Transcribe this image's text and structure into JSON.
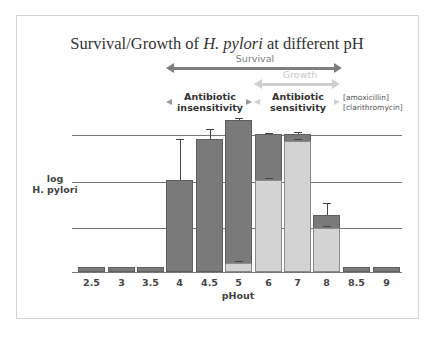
{
  "chart_data": {
    "type": "bar",
    "title": "Survival/Growth of H. pylori at different pH",
    "xlabel": "pHout",
    "ylabel": "log H. pylori",
    "categories": [
      "2.5",
      "3",
      "3.5",
      "4",
      "4.5",
      "5",
      "6",
      "7",
      "8",
      "8.5",
      "9"
    ],
    "series": [
      {
        "name": "Survival (dark)",
        "values": [
          0.1,
          0.1,
          0.1,
          2.0,
          2.9,
          3.3,
          3.0,
          3.0,
          1.25,
          0.1,
          0.1
        ],
        "error_upper": [
          null,
          null,
          null,
          2.9,
          3.1,
          3.35,
          3.02,
          3.05,
          1.5,
          null,
          null
        ],
        "color": "#7a7a7a"
      },
      {
        "name": "Growth (light)",
        "values": [
          0,
          0,
          0,
          0,
          0,
          0.2,
          2.0,
          2.85,
          0.95,
          0,
          0
        ],
        "color": "#d3d3d3"
      }
    ],
    "ylim": [
      0,
      3.4
    ],
    "gridlines": [
      1,
      2,
      3
    ],
    "grid": true,
    "annotations": [
      {
        "text": "Survival",
        "type": "arrow",
        "from": "4",
        "to": "8"
      },
      {
        "text": "Growth",
        "type": "arrow",
        "from": "6",
        "to": "8"
      },
      {
        "text": "Antibiotic insensitivity",
        "type": "arrow",
        "from": "4",
        "to": "5"
      },
      {
        "text": "Antibiotic sensitivity",
        "type": "arrow",
        "from": "6",
        "to": "8"
      },
      {
        "text": "[amoxicillin] [clarithromycin]"
      }
    ]
  },
  "title": {
    "prefix": "Survival/Growth of ",
    "italic": "H. pylori",
    "suffix": " at different pH"
  },
  "arrows": {
    "survival": {
      "label": "Survival",
      "color": "#7d7d7d"
    },
    "growth": {
      "label": "Growth",
      "color": "#cfcfcf"
    }
  },
  "antibiotic": {
    "insensitivity_line1": "Antibiotic",
    "insensitivity_line2": "insensitivity",
    "sensitivity_line1": "Antibiotic",
    "sensitivity_line2": "sensitivity",
    "drug1": "[amoxicillin]",
    "drug2": "[clarithromycin]"
  },
  "ylabel": {
    "line1": "log",
    "line2": "H. pylori"
  },
  "xlabel": "pHout",
  "xticks": [
    "2.5",
    "3",
    "3.5",
    "4",
    "4.5",
    "5",
    "6",
    "7",
    "8",
    "8.5",
    "9"
  ]
}
